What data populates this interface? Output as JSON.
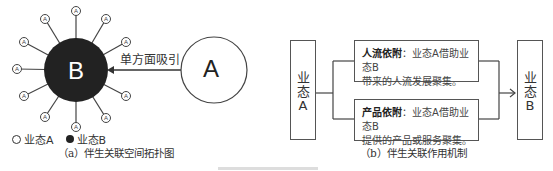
{
  "diagram_a": {
    "center_node": {
      "label": "B",
      "color": "#222222"
    },
    "satellite_label": "A",
    "satellite_count": 12,
    "external_node": {
      "label": "A"
    },
    "arrow_label": "单方面吸引",
    "legend": {
      "item_a": "业态A",
      "item_b": "业态B"
    },
    "caption": "（a）伴生关联空间拓扑图"
  },
  "diagram_b": {
    "left_node": {
      "line1": "业",
      "line2": "态",
      "line3": "A"
    },
    "right_node": {
      "line1": "业",
      "line2": "态",
      "line3": "B"
    },
    "mechanisms": [
      {
        "title": "人流依附",
        "sep": "：",
        "text1": "业态A借助业态B",
        "text2": "带来的人流发展聚集。"
      },
      {
        "title": "产品依附",
        "sep": "：",
        "text1": "业态A借助业态B",
        "text2": "提供的产品或服务聚集。"
      }
    ],
    "caption": "（b）伴生关联作用机制"
  }
}
